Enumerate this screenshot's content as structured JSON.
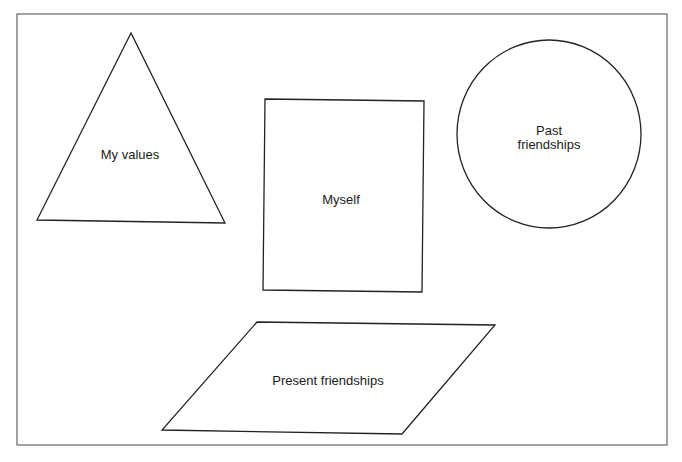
{
  "diagram": {
    "shapes": [
      {
        "id": "triangle",
        "label": "My values"
      },
      {
        "id": "rectangle",
        "label": "Myself"
      },
      {
        "id": "circle",
        "label_line1": "Past",
        "label_line2": "friendships"
      },
      {
        "id": "parallelogram",
        "label": "Present friendships"
      }
    ],
    "colors": {
      "stroke": "#222222",
      "frame": "#555555",
      "background": "#ffffff"
    }
  }
}
